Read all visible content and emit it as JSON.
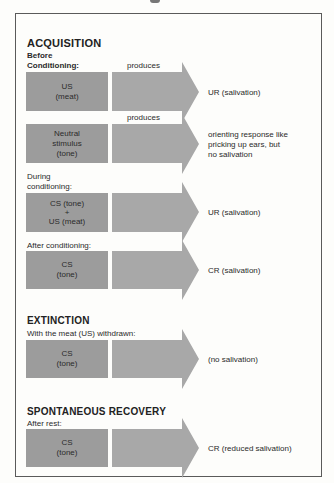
{
  "sections": {
    "acquisition": {
      "title": "ACQUISITION",
      "before_label_line1": "Before",
      "before_label_line2": "Conditioning:",
      "produces_1": "produces",
      "produces_2": "produces",
      "row1": {
        "stimulus_line1": "US",
        "stimulus_line2": "(meat)",
        "response": "UR (salivation)"
      },
      "row2": {
        "stimulus_line1": "Neutral",
        "stimulus_line2": "stimulus",
        "stimulus_line3": "(tone)",
        "response_line1": "orienting response like",
        "response_line2": "pricking up ears, but",
        "response_line3": "no salivation"
      },
      "during_label_line1": "During",
      "during_label_line2": "conditioning:",
      "row3": {
        "stimulus_line1": "CS (tone)",
        "stimulus_line2": "+",
        "stimulus_line3": "US (meat)",
        "response": "UR (salivation)"
      },
      "after_label": "After conditioning:",
      "row4": {
        "stimulus_line1": "CS",
        "stimulus_line2": "(tone)",
        "response": "CR (salivation)"
      }
    },
    "extinction": {
      "title": "EXTINCTION",
      "label": "With the meat (US) withdrawn:",
      "row": {
        "stimulus_line1": "CS",
        "stimulus_line2": "(tone)",
        "response": "(no salivation)"
      }
    },
    "recovery": {
      "title": "SPONTANEOUS RECOVERY",
      "label": "After rest:",
      "row": {
        "stimulus_line1": "CS",
        "stimulus_line2": "(tone)",
        "response": "CR (reduced salivation)"
      }
    }
  },
  "colors": {
    "box": "#9c9c9c",
    "arrow": "#a8a8a8",
    "border": "#5a5a5a"
  }
}
